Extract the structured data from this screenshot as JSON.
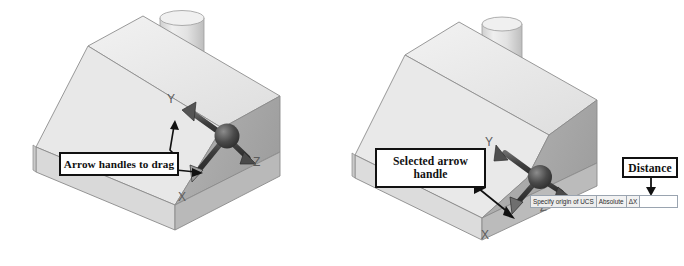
{
  "figure": {
    "background": "#ffffff",
    "ink": "#111111",
    "panels": [
      {
        "id": "left",
        "name": "ucs-gizmo-unselected",
        "callout": {
          "label": "Arrow handles to drag"
        },
        "axis_labels": {
          "x": "X",
          "y": "Y",
          "z": "Z"
        }
      },
      {
        "id": "right",
        "name": "ucs-gizmo-selected",
        "callout": {
          "label": "Selected arrow\nhandle",
          "line1": "Selected arrow",
          "line2": "handle"
        },
        "distance_callout": {
          "label": "Distance"
        },
        "axis_labels": {
          "x": "X",
          "y": "Y",
          "z": "Z"
        },
        "dynamic_input": {
          "prompt": "Specify origin of UCS",
          "mode": "Absolute",
          "field_label": "ΔX",
          "field_value": ""
        }
      }
    ],
    "colors": {
      "solid_top": "#ececec",
      "solid_slant": "#e2e2e2",
      "solid_right": "#ababab",
      "solid_front": "#d4d4d4",
      "edge": "#8a8a8a",
      "gizmo": "#3a3a3a",
      "axis_text": "#5c5c5c"
    }
  }
}
